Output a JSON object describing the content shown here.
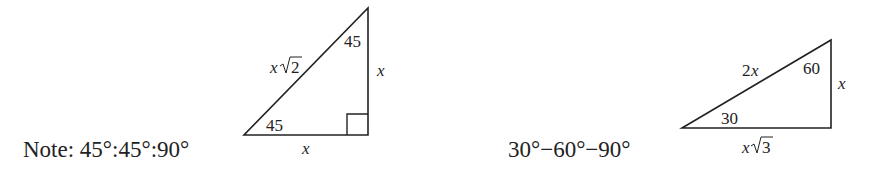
{
  "diagram": {
    "left": {
      "caption": "Note: 45°:45°:90°",
      "angle_bottom": "45",
      "angle_top": "45",
      "hypotenuse_var": "x",
      "hypotenuse_root": "2",
      "vertical_side": "x",
      "base_side": "x"
    },
    "right": {
      "caption": "30°−60°−90°",
      "angle_left": "30",
      "angle_top": "60",
      "hypotenuse": "2x",
      "hyp_num": "2",
      "hyp_var": "x",
      "vertical_side": "x",
      "base_var": "x",
      "base_root": "3"
    }
  }
}
